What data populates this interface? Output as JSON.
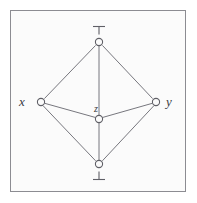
{
  "figure": {
    "kind": "hasse-diagram",
    "caption": "",
    "frame": {
      "border_color": "#8c8c92",
      "background_color": "#fbfbfb",
      "outer_background_color": "#ffffff"
    },
    "stroke_color": "#77777e",
    "node_stroke_color": "#5f5f66",
    "label_color": "#3a3a40"
  },
  "nodes": [
    {
      "id": "top",
      "label": "",
      "symbol": "top-verum",
      "x": 99,
      "y": 42
    },
    {
      "id": "x",
      "label": "x",
      "symbol": "",
      "x": 41,
      "y": 102
    },
    {
      "id": "y",
      "label": "y",
      "symbol": "",
      "x": 156,
      "y": 102
    },
    {
      "id": "z",
      "label": "z",
      "symbol": "",
      "x": 99,
      "y": 119
    },
    {
      "id": "bottom",
      "label": "",
      "symbol": "bottom-falsum",
      "x": 99,
      "y": 164
    }
  ],
  "edges": [
    {
      "from": "top",
      "to": "x"
    },
    {
      "from": "top",
      "to": "y"
    },
    {
      "from": "top",
      "to": "z"
    },
    {
      "from": "x",
      "to": "z"
    },
    {
      "from": "y",
      "to": "z"
    },
    {
      "from": "x",
      "to": "bottom"
    },
    {
      "from": "y",
      "to": "bottom"
    },
    {
      "from": "z",
      "to": "bottom"
    }
  ],
  "symbols": {
    "top": "⊤",
    "bottom": "⊥"
  }
}
